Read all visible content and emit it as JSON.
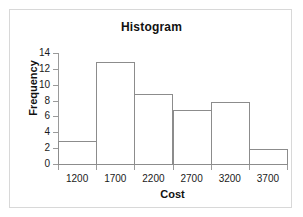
{
  "chart_data": {
    "type": "bar",
    "title": "Histogram",
    "xlabel": "Cost",
    "ylabel": "Frequency",
    "categories": [
      "1200",
      "1700",
      "2200",
      "2700",
      "3200",
      "3700"
    ],
    "values": [
      3,
      13,
      9,
      7,
      8,
      2
    ],
    "ylim": [
      0,
      14
    ],
    "yticks": [
      "0",
      "2",
      "4",
      "6",
      "8",
      "10",
      "12",
      "14"
    ],
    "ytick_values": [
      0,
      2,
      4,
      6,
      8,
      10,
      12,
      14
    ],
    "grid": false,
    "legend": false,
    "bar_fill_color": "#ffffff",
    "bar_stroke_color": "#8c8c8c",
    "axis_color": "#9a9a9a",
    "frame_color": "#d8d8d8",
    "text_color": "#111111",
    "bin_labels_position": "bin-center"
  }
}
